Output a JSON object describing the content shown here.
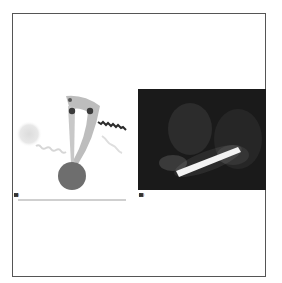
{
  "figure": {
    "panels": [
      {
        "label": "(a)",
        "type": "diagram",
        "description": "Schematic: glowing light sphere emitting wavy rays toward a curved gray arm attached to a dark sphere, with two numbered circle markers and a dark zigzag wave",
        "markers": [
          "1",
          "2"
        ]
      },
      {
        "label": "(b)",
        "type": "photo",
        "description": "Dark photograph of a person holding a glowing light stick"
      }
    ],
    "caption": "Caption text (illegible at this resolution)"
  },
  "colors": {
    "border": "#555555",
    "sphere": "#6e6e6e",
    "arm": "#bdbdbd",
    "glow": "#e4e4e4",
    "photo_bg": "#1a1a1a",
    "light_stick": "#f2f2f2"
  }
}
